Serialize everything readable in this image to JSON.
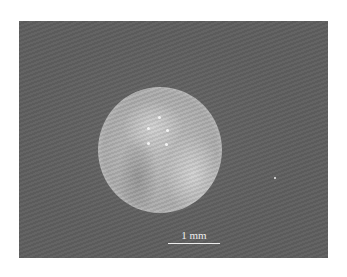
{
  "figure": {
    "background_color": "#5e5e5e",
    "sphere_color": "#b5b5b5",
    "scale_bar": {
      "label": "1 mm"
    }
  }
}
